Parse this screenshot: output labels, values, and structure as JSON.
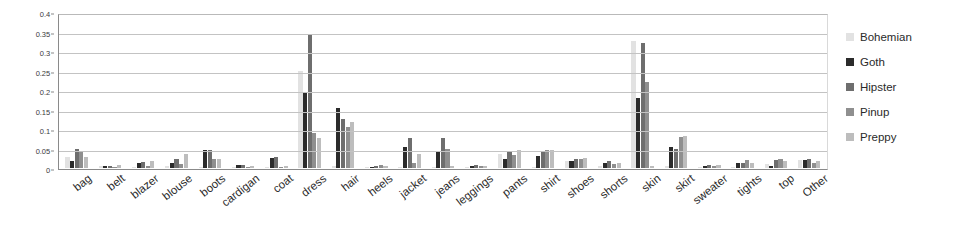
{
  "chart_data": {
    "type": "bar",
    "title": "",
    "xlabel": "",
    "ylabel": "",
    "ylim": [
      0,
      0.4
    ],
    "grid": true,
    "legend_position": "right",
    "y_ticks": [
      "0",
      "0.05",
      "0.1",
      "0.15",
      "0.2",
      "0.25",
      "0.3",
      "0.35",
      "0.4"
    ],
    "y_tick_values": [
      0,
      0.05,
      0.1,
      0.15,
      0.2,
      0.25,
      0.3,
      0.35,
      0.4
    ],
    "categories": [
      "bag",
      "belt",
      "blazer",
      "blouse",
      "boots",
      "cardigan",
      "coat",
      "dress",
      "hair",
      "heels",
      "jacket",
      "jeans",
      "leggings",
      "pants",
      "shirt",
      "shoes",
      "shorts",
      "skin",
      "skirt",
      "sweater",
      "tights",
      "top",
      "Other"
    ],
    "series": [
      {
        "name": "Bohemian",
        "color": "#e2e2e2",
        "values": [
          0.028,
          0.004,
          0.002,
          0.004,
          0.003,
          0.002,
          0.002,
          0.249,
          0.004,
          0.002,
          0.002,
          0.002,
          0.002,
          0.037,
          0.002,
          0.018,
          0.004,
          0.325,
          0.006,
          0.003,
          0.002,
          0.01,
          0.021
        ]
      },
      {
        "name": "Goth",
        "color": "#2b2b2b",
        "values": [
          0.019,
          0.006,
          0.014,
          0.013,
          0.046,
          0.008,
          0.025,
          0.195,
          0.155,
          0.003,
          0.053,
          0.041,
          0.004,
          0.022,
          0.031,
          0.018,
          0.013,
          0.18,
          0.055,
          0.006,
          0.012,
          0.005,
          0.02
        ]
      },
      {
        "name": "Hipster",
        "color": "#6e6e6e",
        "values": [
          0.048,
          0.005,
          0.015,
          0.022,
          0.046,
          0.007,
          0.027,
          0.34,
          0.125,
          0.004,
          0.077,
          0.077,
          0.007,
          0.044,
          0.04,
          0.022,
          0.018,
          0.32,
          0.05,
          0.008,
          0.013,
          0.02,
          0.022
        ]
      },
      {
        "name": "Pinup",
        "color": "#8f8f8f",
        "values": [
          0.041,
          0.003,
          0.006,
          0.011,
          0.023,
          0.003,
          0.003,
          0.09,
          0.105,
          0.007,
          0.014,
          0.048,
          0.005,
          0.033,
          0.045,
          0.023,
          0.01,
          0.22,
          0.079,
          0.004,
          0.02,
          0.023,
          0.012
        ]
      },
      {
        "name": "Preppy",
        "color": "#bdbdbd",
        "values": [
          0.028,
          0.008,
          0.019,
          0.036,
          0.022,
          0.006,
          0.004,
          0.078,
          0.119,
          0.006,
          0.035,
          0.005,
          0.006,
          0.047,
          0.046,
          0.026,
          0.013,
          0.006,
          0.082,
          0.008,
          0.014,
          0.018,
          0.017
        ]
      }
    ]
  },
  "legend": {
    "items": [
      {
        "label": "Bohemian",
        "color": "#e2e2e2"
      },
      {
        "label": "Goth",
        "color": "#2b2b2b"
      },
      {
        "label": "Hipster",
        "color": "#6e6e6e"
      },
      {
        "label": "Pinup",
        "color": "#8f8f8f"
      },
      {
        "label": "Preppy",
        "color": "#bdbdbd"
      }
    ]
  }
}
